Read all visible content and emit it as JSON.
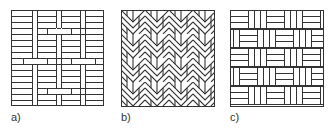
{
  "figure": {
    "panels": [
      {
        "id": "a",
        "label": "a)",
        "pattern": "stack-bond-with-vertical-strips"
      },
      {
        "id": "b",
        "label": "b)",
        "pattern": "herringbone"
      },
      {
        "id": "c",
        "label": "c)",
        "pattern": "basket-weave"
      }
    ],
    "colors": {
      "line": "#333333",
      "fill": "#ffffff"
    }
  }
}
